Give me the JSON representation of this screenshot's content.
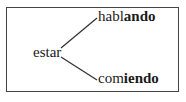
{
  "diagram": {
    "root": "estar",
    "branches": [
      {
        "stem": "habl",
        "ending": "ando",
        "full": "hablando"
      },
      {
        "stem": "com",
        "ending": "iendo",
        "full": "comiendo"
      }
    ],
    "colors": {
      "line": "#333333",
      "text": "#1a1a1a",
      "border": "#444444"
    }
  }
}
